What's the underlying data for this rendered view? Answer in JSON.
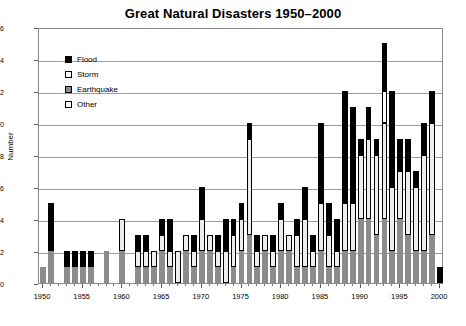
{
  "chart_data": {
    "type": "bar",
    "title": "Great Natural Disasters 1950–2000",
    "xlabel": "",
    "ylabel": "Number",
    "ylim": [
      0,
      16
    ],
    "ytick_step": 2,
    "yticks": [
      0,
      2,
      4,
      6,
      8,
      10,
      12,
      14,
      16
    ],
    "grid": "horizontal",
    "stacked": true,
    "legend_position": "upper-left-inside",
    "xticks": [
      1950,
      1955,
      1960,
      1965,
      1970,
      1975,
      1980,
      1985,
      1990,
      1995,
      2000
    ],
    "categories": [
      1950,
      1951,
      1952,
      1953,
      1954,
      1955,
      1956,
      1957,
      1958,
      1959,
      1960,
      1961,
      1962,
      1963,
      1964,
      1965,
      1966,
      1967,
      1968,
      1969,
      1970,
      1971,
      1972,
      1973,
      1974,
      1975,
      1976,
      1977,
      1978,
      1979,
      1980,
      1981,
      1982,
      1983,
      1984,
      1985,
      1986,
      1987,
      1988,
      1989,
      1990,
      1991,
      1992,
      1993,
      1994,
      1995,
      1996,
      1997,
      1998,
      1999,
      2000
    ],
    "series": [
      {
        "name": "Earthquake",
        "key": "quake",
        "color": "#8c8c8c",
        "values": [
          1,
          2,
          0,
          1,
          1,
          1,
          1,
          0,
          2,
          0,
          2,
          0,
          1,
          1,
          1,
          2,
          1,
          0,
          2,
          1,
          2,
          2,
          1,
          0,
          1,
          2,
          3,
          1,
          2,
          1,
          2,
          2,
          1,
          1,
          1,
          2,
          1,
          1,
          2,
          2,
          4,
          4,
          3,
          4,
          2,
          4,
          3,
          2,
          2,
          3,
          0
        ]
      },
      {
        "name": "Other",
        "key": "other",
        "color": "#ededed",
        "values": [
          0,
          0,
          0,
          0,
          0,
          0,
          0,
          0,
          0,
          0,
          2,
          0,
          1,
          1,
          1,
          1,
          1,
          2,
          1,
          1,
          2,
          1,
          1,
          2,
          2,
          2,
          6,
          1,
          1,
          1,
          2,
          1,
          2,
          3,
          1,
          3,
          2,
          1,
          3,
          3,
          4,
          5,
          5,
          6,
          4,
          3,
          4,
          4,
          6,
          7,
          0
        ]
      },
      {
        "name": "Storm",
        "key": "storm",
        "color": "#ffffff",
        "values": [
          0,
          0,
          0,
          0,
          0,
          0,
          0,
          0,
          0,
          0,
          0,
          0,
          0,
          0,
          0,
          0,
          0,
          0,
          0,
          0,
          0,
          0,
          0,
          0,
          0,
          0,
          0,
          0,
          0,
          0,
          0,
          0,
          0,
          0,
          0,
          0,
          0,
          0,
          0,
          0,
          0,
          0,
          0,
          2,
          0,
          0,
          0,
          0,
          0,
          0,
          0
        ]
      },
      {
        "name": "Flood",
        "key": "flood",
        "color": "#000000",
        "values": [
          0,
          3,
          0,
          1,
          1,
          1,
          1,
          0,
          0,
          0,
          0,
          0,
          1,
          1,
          0,
          1,
          2,
          0,
          0,
          1,
          2,
          0,
          1,
          2,
          1,
          1,
          1,
          1,
          0,
          1,
          1,
          0,
          1,
          2,
          1,
          5,
          2,
          2,
          7,
          6,
          1,
          2,
          1,
          3,
          6,
          2,
          2,
          1,
          2,
          2,
          1
        ]
      }
    ],
    "totals": [
      1,
      5,
      0,
      2,
      2,
      2,
      2,
      0,
      2,
      0,
      4,
      0,
      3,
      3,
      2,
      4,
      4,
      2,
      3,
      3,
      6,
      3,
      3,
      4,
      4,
      5,
      10,
      3,
      3,
      3,
      5,
      3,
      4,
      6,
      3,
      10,
      5,
      4,
      12,
      11,
      9,
      11,
      9,
      15,
      12,
      9,
      9,
      7,
      10,
      12,
      1
    ]
  },
  "legend": {
    "items": [
      {
        "label": "Flood",
        "swatch": "flood-swatch"
      },
      {
        "label": "Storm",
        "swatch": "storm-swatch"
      },
      {
        "label": "Earthquake",
        "swatch": "earthquake-swatch"
      },
      {
        "label": "Other",
        "swatch": "other-swatch"
      }
    ]
  }
}
